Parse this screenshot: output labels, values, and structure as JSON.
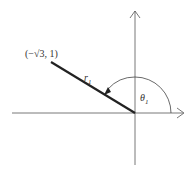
{
  "diagram": {
    "point_label": "(−√3, 1)",
    "radius_label": "r",
    "radius_subscript": "1",
    "angle_label": "θ",
    "angle_subscript": "1"
  },
  "colors": {
    "line": "#222222",
    "axis": "#555555"
  }
}
